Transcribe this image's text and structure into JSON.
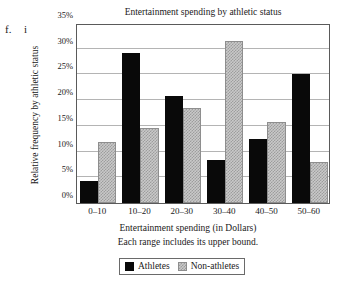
{
  "markers": {
    "letter": "f.",
    "roman": "i"
  },
  "chart_data": {
    "type": "bar",
    "title": "Entertainment spending by athletic status",
    "xlabel": "Entertainment spending (in Dollars)",
    "xnote": "Each range includes its upper bound.",
    "ylabel": "Relative frequency by athletic status",
    "categories": [
      "0–10",
      "10–20",
      "20–30",
      "30–40",
      "40–50",
      "50–60"
    ],
    "series": [
      {
        "name": "Athletes",
        "color": "#090909",
        "values": [
          4.2,
          29.2,
          20.8,
          8.4,
          12.5,
          25.0
        ]
      },
      {
        "name": "Non-athletes",
        "color": "#c9c9c9",
        "values": [
          11.8,
          14.6,
          18.4,
          31.5,
          15.7,
          8.0
        ]
      }
    ],
    "ylim": [
      0,
      35
    ],
    "ytick_values": [
      0,
      5,
      10,
      15,
      20,
      25,
      30,
      35
    ],
    "ytick_labels": [
      "0%",
      "5%",
      "10%",
      "15%",
      "20%",
      "25%",
      "30%",
      "35%"
    ],
    "grid": true,
    "legend_position": "bottom"
  }
}
